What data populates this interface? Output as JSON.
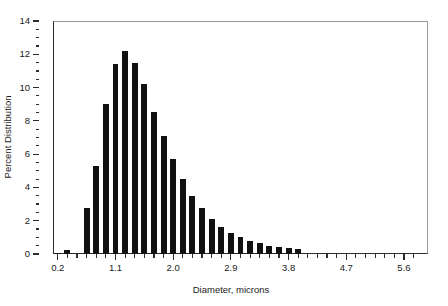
{
  "chart_data": {
    "type": "bar",
    "title": "",
    "subtitle": "",
    "xlabel": "Diameter, microns",
    "ylabel": "Percent Distribution",
    "xlim": [
      0.125,
      5.975
    ],
    "ylim": [
      0,
      14
    ],
    "grid": false,
    "legend": null,
    "bar_color": "#111111",
    "bin_width": 0.15,
    "x_tick_labels": [
      "0.2",
      "1.1",
      "2.0",
      "2.9",
      "3.8",
      "4.7",
      "5.6"
    ],
    "x_tick_values": [
      0.2,
      1.1,
      2.0,
      2.9,
      3.8,
      4.7,
      5.6
    ],
    "y_tick_labels": [
      "0",
      "2",
      "4",
      "6",
      "8",
      "10",
      "12",
      "14"
    ],
    "y_tick_values": [
      0,
      2,
      4,
      6,
      8,
      10,
      12,
      14
    ],
    "y_minor_step": 0.5,
    "categories": [
      "0.20",
      "0.35",
      "0.50",
      "0.65",
      "0.80",
      "0.95",
      "1.10",
      "1.25",
      "1.40",
      "1.55",
      "1.70",
      "1.85",
      "2.00",
      "2.15",
      "2.30",
      "2.45",
      "2.60",
      "2.75",
      "2.90",
      "3.05",
      "3.20",
      "3.35",
      "3.50",
      "3.65",
      "3.80",
      "3.95",
      "4.10",
      "4.25",
      "4.40",
      "4.55",
      "4.70",
      "4.85",
      "5.00",
      "5.15",
      "5.30",
      "5.45",
      "5.60",
      "5.75"
    ],
    "values": [
      0.05,
      0.25,
      0.0,
      2.75,
      5.3,
      9.0,
      11.4,
      12.2,
      11.5,
      10.2,
      8.55,
      7.1,
      5.7,
      4.5,
      3.5,
      2.75,
      2.1,
      1.65,
      1.25,
      1.0,
      0.8,
      0.65,
      0.5,
      0.4,
      0.35,
      0.3,
      0.0,
      0.0,
      0.0,
      0.0,
      0.0,
      0.0,
      0.0,
      0.0,
      0.0,
      0.0,
      0.0,
      0.0
    ]
  },
  "axes": {
    "x_title": "Diameter, microns",
    "y_title": "Percent Distribution"
  }
}
